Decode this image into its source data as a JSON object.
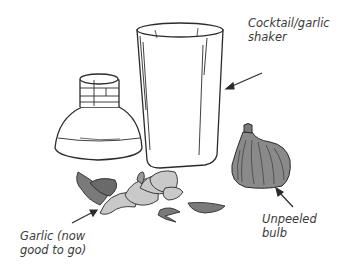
{
  "figure": {
    "labels": {
      "shaker": "Cocktail/garlic\nshaker",
      "garlic": "Garlic (now\ngood to go)",
      "bulb": "Unpeeled\nbulb"
    },
    "icons": {
      "shaker_cup": "tall-tumbler",
      "shaker_lid": "shaker-cap",
      "bulb": "garlic-bulb",
      "cloves": "peeled-garlic-cloves",
      "skins": "garlic-skins"
    },
    "colors": {
      "line": "#2b2b2b",
      "garlic_fill": "#c9c9c9",
      "bulb_fill": "#8a8a8a",
      "skin_fill": "#7a7a7a",
      "label_text": "#3a3a3a",
      "background": "#ffffff"
    }
  }
}
